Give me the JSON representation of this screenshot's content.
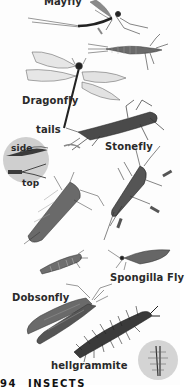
{
  "page": {
    "number": "94",
    "heading": "INSECTS",
    "illustrations": [
      {
        "id": "mayfly",
        "label": "Mayfly"
      },
      {
        "id": "mayfly-nymph",
        "label": ""
      },
      {
        "id": "dragonfly",
        "label": "Dragonfly"
      },
      {
        "id": "stonefly",
        "label": "Stonefly"
      },
      {
        "id": "tails-inset",
        "label": "tails",
        "sub_labels": [
          "side",
          "top"
        ]
      },
      {
        "id": "stonefly-nymph",
        "label": ""
      },
      {
        "id": "spongilla-fly",
        "label": "Spongilla Fly"
      },
      {
        "id": "spongilla-larva",
        "label": ""
      },
      {
        "id": "dobsonfly",
        "label": "Dobsonfly"
      },
      {
        "id": "hellgrammite",
        "label": "hellgrammite"
      },
      {
        "id": "gill-inset",
        "label": ""
      }
    ]
  },
  "colors": {
    "ink": "#2a2a2a",
    "wing": "#9a9a9a",
    "inset_bg": "#cfcfcf"
  }
}
